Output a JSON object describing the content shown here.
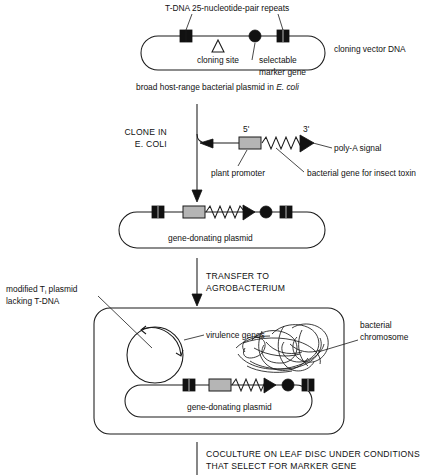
{
  "figure": {
    "title_text": "Agrobacterium-mediated plant transformation workflow",
    "colors": {
      "ink": "#111111",
      "promoter_fill": "#b5b5b5",
      "background": "#ffffff"
    }
  },
  "stage_vector": {
    "top_label": "T-DNA 25-nucleotide-pair repeats",
    "cloning_site_label": "cloning site",
    "marker_label_line1": "selectable",
    "marker_label_line2": "marker gene",
    "right_label": "cloning vector DNA",
    "caption_pre": "broad host-range bacterial plasmid in ",
    "caption_species": "E. coli"
  },
  "stage_clone": {
    "step_line1": "CLONE IN",
    "step_line2": "E. COLI",
    "five_prime": "5'",
    "three_prime": "3'",
    "promoter_label": "plant promoter",
    "polya_label": "poly-A signal",
    "gene_label": "bacterial gene for insect toxin"
  },
  "stage_donor": {
    "plasmid_label": "gene-donating plasmid",
    "step_line1": "TRANSFER TO",
    "step_line2": "AGROBACTERIUM"
  },
  "stage_agrobacterium": {
    "ti_label_line1_pre": "modified T",
    "ti_label_line1_sub": "i",
    "ti_label_line1_post": " plasmid",
    "ti_label_line2": "lacking T-DNA",
    "virulence_label": "virulence genes",
    "chromosome_label_line1": "bacterial",
    "chromosome_label_line2": "chromosome",
    "plasmid_label": "gene-donating plasmid"
  },
  "stage_final": {
    "step_line1": "COCULTURE ON LEAF DISC UNDER CONDITIONS",
    "step_line2": "THAT SELECT FOR MARKER GENE"
  },
  "icons": {
    "repeat_square": "black-square-icon",
    "cloning_site_triangle": "open-triangle-icon",
    "marker_circle": "black-circle-icon",
    "promoter_box": "gray-rectangle-icon",
    "gene_zigzag": "zigzag-line-icon",
    "polya_arrowhead": "black-triangle-icon",
    "flow_arrow": "down-arrow-icon",
    "virulence_arc": "arc-arrow-icon",
    "chromosome_tangle": "tangled-loop-icon"
  }
}
